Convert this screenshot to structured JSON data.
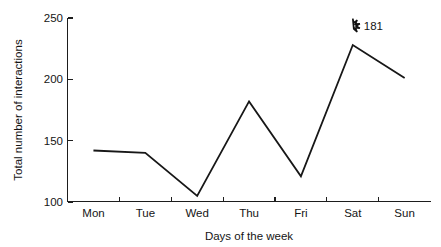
{
  "chart_data": {
    "type": "line",
    "title": "",
    "subtitle": "",
    "xlabel": "Days of the week",
    "ylabel": "Total number of interactions",
    "categories": [
      "Mon",
      "Tue",
      "Wed",
      "Thu",
      "Fri",
      "Sat",
      "Sun"
    ],
    "values": [
      142,
      140,
      105,
      182,
      121,
      228,
      201
    ],
    "series": [
      {
        "name": "Total number of interactions",
        "values": [
          142,
          140,
          105,
          182,
          121,
          228,
          201
        ]
      }
    ],
    "ylim": [
      100,
      250
    ],
    "y_ticks": [
      100,
      150,
      200,
      250
    ],
    "y_tick_labels": [
      "100",
      "150",
      "200",
      "250"
    ],
    "x_tick_labels": [
      "Mon",
      "Tue",
      "Wed",
      "Thu",
      "Fri",
      "Sat",
      "Sun"
    ],
    "grid": false,
    "legend": false,
    "legend_position": "none",
    "line_color": "#171717",
    "axis_color": "#1d1d1d",
    "background_color": "#ffffff",
    "annotations": [
      {
        "marker": "star-outline",
        "label": "181",
        "category": "Sat",
        "value": 228
      }
    ]
  },
  "axes": {
    "y_title": "Total number of interactions",
    "x_title": "Days of the week"
  },
  "annotation": {
    "star_value_label": "181"
  }
}
